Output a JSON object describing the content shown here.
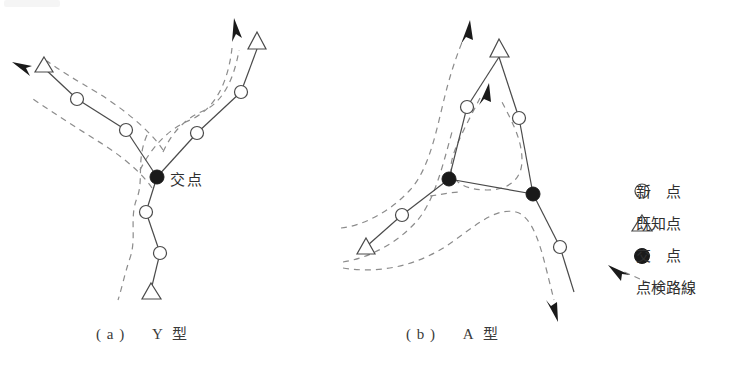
{
  "figure": {
    "background_color": "#ffffff",
    "line_color": "#4a4a4a",
    "dash_color": "#8c8c8c",
    "fill_color": "#1a1a1a",
    "text_color": "#2f2f2f"
  },
  "panels": [
    {
      "id": "a",
      "caption_label": "( a )",
      "caption_type": "Y 型",
      "intersection_label": "交点",
      "nodes": [
        {
          "name": "known-point-upper-left",
          "type": "triangle",
          "x": 44,
          "y": 68
        },
        {
          "name": "new-point-a1",
          "type": "circle",
          "x": 77,
          "y": 99
        },
        {
          "name": "new-point-a2",
          "type": "circle",
          "x": 126,
          "y": 130
        },
        {
          "name": "intersection-point-a",
          "type": "filled",
          "x": 157,
          "y": 177
        },
        {
          "name": "new-point-a3",
          "type": "circle",
          "x": 197,
          "y": 133
        },
        {
          "name": "new-point-a4",
          "type": "circle",
          "x": 241,
          "y": 92
        },
        {
          "name": "known-point-upper-right",
          "type": "triangle",
          "x": 257,
          "y": 43
        },
        {
          "name": "new-point-a5",
          "type": "circle",
          "x": 146,
          "y": 212
        },
        {
          "name": "new-point-a6",
          "type": "circle",
          "x": 160,
          "y": 253
        },
        {
          "name": "known-point-lower",
          "type": "triangle",
          "x": 151,
          "y": 294
        }
      ],
      "edges": [
        [
          0,
          1
        ],
        [
          1,
          2
        ],
        [
          2,
          3
        ],
        [
          3,
          4
        ],
        [
          4,
          5
        ],
        [
          5,
          6
        ],
        [
          3,
          7
        ],
        [
          7,
          8
        ],
        [
          8,
          9
        ]
      ]
    },
    {
      "id": "b",
      "caption_label": "( b )",
      "caption_type": "A 型",
      "nodes": [
        {
          "name": "known-point-apex",
          "type": "triangle",
          "x": 499,
          "y": 51
        },
        {
          "name": "new-point-b1",
          "type": "circle",
          "x": 467,
          "y": 107
        },
        {
          "name": "intersection-point-b-left",
          "type": "filled",
          "x": 449,
          "y": 179
        },
        {
          "name": "new-point-b2",
          "type": "circle",
          "x": 519,
          "y": 118
        },
        {
          "name": "intersection-point-b-right",
          "type": "filled",
          "x": 533,
          "y": 194
        },
        {
          "name": "new-point-b3",
          "type": "circle",
          "x": 402,
          "y": 215
        },
        {
          "name": "known-point-lower-left",
          "type": "triangle",
          "x": 366,
          "y": 249
        },
        {
          "name": "new-point-b4",
          "type": "circle",
          "x": 560,
          "y": 247
        }
      ],
      "edges": [
        [
          0,
          1
        ],
        [
          1,
          2
        ],
        [
          0,
          3
        ],
        [
          3,
          4
        ],
        [
          2,
          4
        ],
        [
          2,
          5
        ],
        [
          5,
          6
        ],
        [
          4,
          7
        ]
      ],
      "open_end": {
        "from": 7,
        "x": 574,
        "y": 292
      }
    }
  ],
  "legend": {
    "items": [
      {
        "marker": "open-circle",
        "text": "新　点"
      },
      {
        "marker": "open-triangle",
        "text": "既知点"
      },
      {
        "marker": "filled-circle",
        "text": "交　点"
      },
      {
        "marker": "dashed-arrow",
        "text": "点検路線"
      }
    ]
  }
}
